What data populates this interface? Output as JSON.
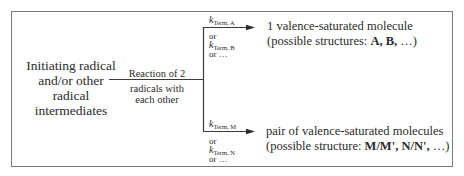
{
  "diagram": {
    "source_node": {
      "lines": [
        "Initiating radical",
        "and/or other",
        "radical",
        "intermediates"
      ]
    },
    "reaction_label": {
      "above": "Reaction of 2",
      "below_lines": [
        "radicals with",
        "each other"
      ]
    },
    "branches": [
      {
        "rate_constant": {
          "symbol": "k",
          "subscript": "Term, A"
        },
        "alternatives": [
          {
            "text": "or"
          },
          {
            "symbol": "k",
            "subscript": "Term, B"
          },
          {
            "text": "or …"
          }
        ],
        "product": {
          "line1": "1 valence-saturated molecule",
          "line2_prefix": "(possible structures: ",
          "line2_bold": "A, B,",
          "line2_suffix": " …)"
        }
      },
      {
        "rate_constant": {
          "symbol": "k",
          "subscript": "Term, M"
        },
        "alternatives": [
          {
            "text": "or"
          },
          {
            "symbol": "k",
            "subscript": "Term, N"
          },
          {
            "text": "or …"
          }
        ],
        "product": {
          "line1": "pair of valence-saturated molecules",
          "line2_prefix": "(possible structure: ",
          "line2_bold": "M/M', N/N',",
          "line2_suffix": " …)"
        }
      }
    ],
    "colors": {
      "line": "#3a3a3a",
      "frame": "#7a7a7a",
      "text": "#2a2a2a"
    }
  }
}
